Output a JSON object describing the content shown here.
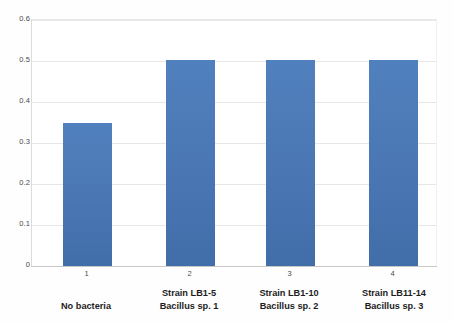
{
  "chart_data": {
    "type": "bar",
    "title": "",
    "subtitle": "",
    "xlabel": "",
    "ylabel": "",
    "categories": [
      "1",
      "2",
      "3",
      "4"
    ],
    "category_labels": [
      {
        "line1": "No bacteria",
        "line2": ""
      },
      {
        "line1": "Strain LB1-5",
        "line2": "Bacillus sp. 1"
      },
      {
        "line1": "Strain LB1-10",
        "line2": "Bacillus sp. 2"
      },
      {
        "line1": "Strain LB11-14",
        "line2": "Bacillus sp. 3"
      }
    ],
    "values": [
      0.35,
      0.505,
      0.505,
      0.505
    ],
    "ylim": [
      0,
      0.6
    ],
    "yticks": [
      "0.6",
      "0.5",
      "0.4",
      "0.3",
      "0.2",
      "0.1",
      "0"
    ],
    "ytick_values": [
      0.6,
      0.5,
      0.4,
      0.3,
      0.2,
      0.1,
      0
    ],
    "grid": true,
    "legend": "none",
    "bar_color": "#4a77b4",
    "gridline_color": "#e6e6e6",
    "axis_color": "#c8c8c8",
    "background_color": "#ffffff"
  },
  "axis": {
    "y": {
      "t0": "0.6",
      "t1": "0.5",
      "t2": "0.4",
      "t3": "0.3",
      "t4": "0.2",
      "t5": "0.1",
      "t6": "0"
    },
    "x": {
      "t0": "1",
      "t1": "2",
      "t2": "3",
      "t3": "4"
    }
  },
  "labels": {
    "cat0_line1": "No bacteria",
    "cat0_line2": "",
    "cat1_line1": "Strain LB1-5",
    "cat1_line2": "Bacillus sp. 1",
    "cat2_line1": "Strain LB1-10",
    "cat2_line2": "Bacillus sp. 2",
    "cat3_line1": "Strain LB11-14",
    "cat3_line2": "Bacillus sp. 3"
  }
}
